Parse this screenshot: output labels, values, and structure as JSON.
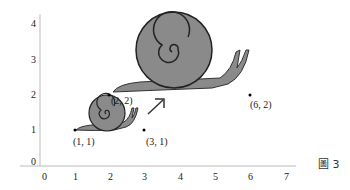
{
  "figure": {
    "caption": "圖 3",
    "x_ticks": [
      "0",
      "1",
      "2",
      "3",
      "4",
      "5",
      "6",
      "7"
    ],
    "y_ticks": [
      "0",
      "1",
      "2",
      "3",
      "4"
    ],
    "points": [
      {
        "label": "(1, 1)",
        "x": 1,
        "y": 1
      },
      {
        "label": "(2, 2)",
        "x": 2,
        "y": 2
      },
      {
        "label": "(3, 1)",
        "x": 3,
        "y": 1
      },
      {
        "label": "(6, 2)",
        "x": 6,
        "y": 2
      }
    ],
    "shapes": [
      {
        "name": "small-snail",
        "color": "#8a8a8a"
      },
      {
        "name": "large-snail",
        "color": "#8a8a8a"
      }
    ],
    "arrow": "enlargement-arrow"
  }
}
